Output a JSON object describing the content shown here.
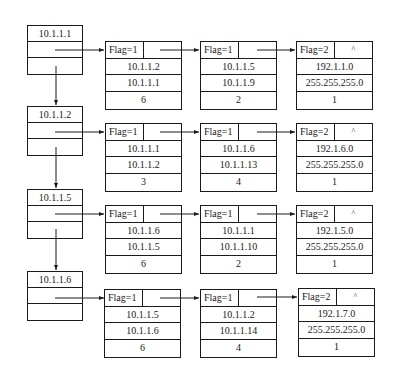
{
  "rows": [
    {
      "head_label": "10.1.1.1",
      "nodes": [
        {
          "flag": "Flag=1",
          "ptr": "",
          "a": "10.1.1.2",
          "b": "10.1.1.1",
          "c": "6"
        },
        {
          "flag": "Flag=1",
          "ptr": "",
          "a": "10.1.1.5",
          "b": "10.1.1.9",
          "c": "2"
        },
        {
          "flag": "Flag=2",
          "ptr": "^",
          "a": "192.1.1.0",
          "b": "255.255.255.0",
          "c": "1"
        }
      ]
    },
    {
      "head_label": "10.1.1.2",
      "nodes": [
        {
          "flag": "Flag=1",
          "ptr": "",
          "a": "10.1.1.1",
          "b": "10.1.1.2",
          "c": "3"
        },
        {
          "flag": "Flag=1",
          "ptr": "",
          "a": "10.1.1.6",
          "b": "10.1.1.13",
          "c": "4"
        },
        {
          "flag": "Flag=2",
          "ptr": "^",
          "a": "192.1.6.0",
          "b": "255.255.255.0",
          "c": "1"
        }
      ]
    },
    {
      "head_label": "10.1.1.5",
      "nodes": [
        {
          "flag": "Flag=1",
          "ptr": "",
          "a": "10.1.1.6",
          "b": "10.1.1.5",
          "c": "6"
        },
        {
          "flag": "Flag=1",
          "ptr": "",
          "a": "10.1.1.1",
          "b": "10.1.1.10",
          "c": "2"
        },
        {
          "flag": "Flag=2",
          "ptr": "^",
          "a": "192.1.5.0",
          "b": "255.255.255.0",
          "c": "1"
        }
      ]
    },
    {
      "head_label": "10.1.1.6",
      "nodes": [
        {
          "flag": "Flag=1",
          "ptr": "",
          "a": "10.1.1.5",
          "b": "10.1.1.6",
          "c": "6"
        },
        {
          "flag": "Flag=1",
          "ptr": "",
          "a": "10.1.1.2",
          "b": "10.1.1.14",
          "c": "4"
        },
        {
          "flag": "Flag=2",
          "ptr": "^",
          "a": "192.1.7.0",
          "b": "255.255.255.0",
          "c": "1"
        }
      ]
    }
  ]
}
